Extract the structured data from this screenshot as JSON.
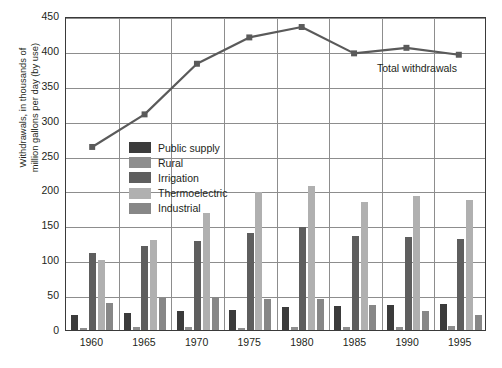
{
  "chart_data": {
    "type": "bar",
    "title": "",
    "xlabel": "",
    "ylabel": "Withdrawals, in thousands of\nmillion gallons per day (by use)",
    "categories": [
      "1960",
      "1965",
      "1970",
      "1975",
      "1980",
      "1985",
      "1990",
      "1995"
    ],
    "ylim": [
      0,
      450
    ],
    "yticks": [
      0,
      50,
      100,
      150,
      200,
      250,
      300,
      350,
      400,
      450
    ],
    "grid": true,
    "legend_position": "inside-upper-left",
    "series": [
      {
        "name": "Public supply",
        "type": "bar",
        "color": "#3b3b3b",
        "values": [
          21,
          24,
          27,
          29,
          33,
          35,
          36,
          38
        ]
      },
      {
        "name": "Rural",
        "type": "bar",
        "color": "#8e8e8e",
        "values": [
          3,
          4,
          4,
          3,
          4,
          5,
          5,
          6
        ]
      },
      {
        "name": "Irrigation",
        "type": "bar",
        "color": "#5e5e5e",
        "values": [
          110,
          120,
          128,
          139,
          148,
          135,
          134,
          130
        ]
      },
      {
        "name": "Thermoelectric",
        "type": "bar",
        "color": "#b0b0b0",
        "values": [
          100,
          129,
          168,
          198,
          207,
          184,
          192,
          186
        ]
      },
      {
        "name": "Industrial",
        "type": "bar",
        "color": "#878787",
        "values": [
          39,
          46,
          47,
          44,
          44,
          36,
          27,
          22
        ]
      }
    ],
    "line_series": {
      "name": "Total withdrawals",
      "type": "line",
      "color": "#5a5a5a",
      "marker": "square",
      "annotation": "Total withdrawals",
      "values": [
        264,
        311,
        384,
        422,
        437,
        399,
        407,
        397
      ]
    }
  },
  "legend": {
    "items": [
      {
        "label": "Public supply",
        "color": "#3b3b3b"
      },
      {
        "label": "Rural",
        "color": "#8e8e8e"
      },
      {
        "label": "Irrigation",
        "color": "#5e5e5e"
      },
      {
        "label": "Thermoelectric",
        "color": "#b0b0b0"
      },
      {
        "label": "Industrial",
        "color": "#878787"
      }
    ]
  },
  "axes": {
    "y_title": "Withdrawals, in thousands of\nmillion gallons per day (by use)",
    "y_ticks": [
      "0",
      "50",
      "100",
      "150",
      "200",
      "250",
      "300",
      "350",
      "400",
      "450"
    ],
    "x_ticks": [
      "1960",
      "1965",
      "1970",
      "1975",
      "1980",
      "1985",
      "1990",
      "1995"
    ]
  },
  "annotation": {
    "total_label": "Total withdrawals"
  },
  "colors": {
    "frame": "#3a3a3a",
    "grid": "#8d8d8d",
    "background": "#ffffff",
    "text": "#231f20",
    "line": "#5a5a5a"
  }
}
